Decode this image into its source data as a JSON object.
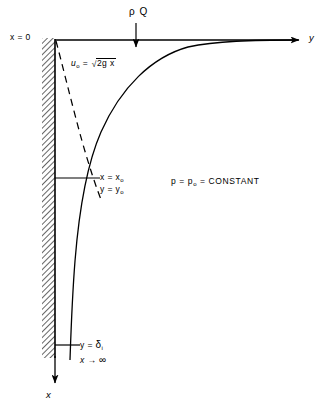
{
  "figure": {
    "type": "technical-diagram",
    "background_color": "#ffffff",
    "line_color": "#000000",
    "width": 336,
    "height": 411
  },
  "axes": {
    "vertical_axis_label": "x",
    "horizontal_axis_label": "y",
    "origin_label": "x = 0",
    "horizontal_axis_y": 40,
    "vertical_axis_x": 55,
    "horizontal_axis_end_x": 300,
    "vertical_axis_end_y": 385
  },
  "wall": {
    "name": "hatched-wall",
    "x_left": 42,
    "x_right": 55,
    "y_top": 38,
    "y_bottom": 358,
    "hatch_angle_deg": 45,
    "hatch_color": "#555555"
  },
  "inflow": {
    "label": "ρ Q",
    "arrow_x": 136,
    "arrow_y_start": 24,
    "arrow_y_end": 48
  },
  "velocity_profile": {
    "name": "free-fall-velocity",
    "label_u": "u",
    "label_u_sub": "o",
    "label_equals": "=",
    "label_radicand": "2g x",
    "full_text": "u₀ = √(2gx)",
    "style": "dashed"
  },
  "point_labels": {
    "x_at_point": "x = x",
    "x_at_point_sub": "o",
    "y_at_point": "y = y",
    "y_at_point_sub": "o",
    "tick_y": 178,
    "tick_x_end": 100
  },
  "pressure": {
    "text_p": "p = p",
    "text_p_sub": "o",
    "text_tail": "= CONSTANT",
    "full_text": "p = p₀ = CONSTANT"
  },
  "asymptote": {
    "y_label": "y =",
    "y_symbol": "δ",
    "y_sub": "i",
    "x_label": "x",
    "x_arrow": "→",
    "x_value": "∞",
    "full_text": "y = δᵢ , x → ∞",
    "tick_y": 345,
    "tick_x_end": 80
  },
  "curves": {
    "film_surface": {
      "name": "film-surface-curve",
      "style": "solid",
      "description": "boundary-layer / free-surface profile asymptotic to horizontal axis at right and to y=delta_i at bottom",
      "path": "M 298 40 C 250 40, 214 41, 186 48 C 150 58, 120 88, 100 133 C 86 164, 78 212, 74 262 C 71 300, 70 330, 70 360"
    },
    "velocity_curve": {
      "name": "velocity-profile-dashed-curve",
      "style": "dashed",
      "description": "dashed sqrt(2gx) velocity distribution curve from origin to intersection point",
      "path": "M 56 40 C 62 62, 72 104, 82 140 C 90 168, 96 186, 101 200"
    }
  }
}
